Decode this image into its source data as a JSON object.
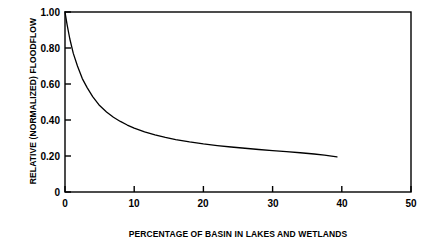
{
  "chart_data": {
    "type": "line",
    "title": "",
    "xlabel": "PERCENTAGE OF BASIN IN LAKES AND WETLANDS",
    "ylabel": "RELATIVE (NORMALIZED) FLOODFLOW",
    "xlim": [
      0,
      50
    ],
    "ylim": [
      0,
      1.0
    ],
    "grid": false,
    "legend": null,
    "xticks": [
      0,
      10,
      20,
      30,
      40,
      50
    ],
    "xtick_labels": [
      "0",
      "10",
      "20",
      "30",
      "40",
      "50"
    ],
    "yticks": [
      0,
      0.2,
      0.4,
      0.6,
      0.8,
      1.0
    ],
    "ytick_labels": [
      "0",
      "0.20",
      "0.40",
      "0.60",
      "0.80",
      "1.00"
    ],
    "series": [
      {
        "name": "relative floodflow",
        "color": "#000000",
        "x": [
          0.0,
          0.3,
          0.7,
          1.2,
          1.8,
          2.5,
          3.2,
          4.0,
          5.0,
          6.0,
          7.0,
          8.0,
          9.0,
          10.0,
          11.5,
          13.0,
          14.5,
          16.0,
          18.0,
          20.0,
          22.0,
          24.0,
          26.0,
          28.0,
          30.0,
          32.0,
          34.0,
          36.0,
          37.5,
          39.3
        ],
        "y": [
          1.0,
          0.93,
          0.85,
          0.77,
          0.7,
          0.63,
          0.58,
          0.53,
          0.48,
          0.445,
          0.415,
          0.392,
          0.372,
          0.355,
          0.334,
          0.317,
          0.303,
          0.291,
          0.278,
          0.267,
          0.258,
          0.25,
          0.243,
          0.236,
          0.23,
          0.224,
          0.218,
          0.211,
          0.205,
          0.195
        ]
      }
    ]
  },
  "axes": {
    "frame_color": "#000000"
  }
}
